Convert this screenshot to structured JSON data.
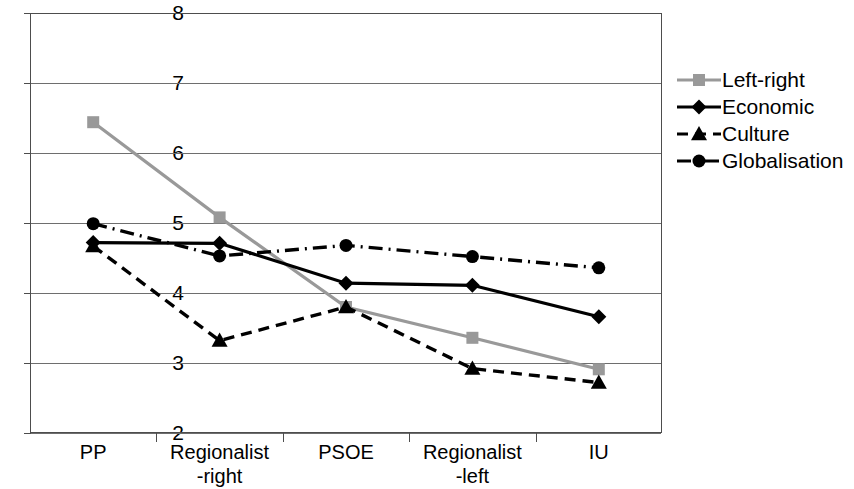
{
  "chart_data": {
    "type": "line",
    "title": "",
    "xlabel": "",
    "ylabel": "",
    "categories": [
      "PP",
      "Regionalist\n-right",
      "PSOE",
      "Regionalist\n-left",
      "IU"
    ],
    "category_labels_line1": [
      "PP",
      "Regionalist",
      "PSOE",
      "Regionalist",
      "IU"
    ],
    "category_labels_line2": [
      "",
      "-right",
      "",
      "-left",
      ""
    ],
    "ylim": [
      2,
      8
    ],
    "yticks": [
      2,
      3,
      4,
      5,
      6,
      7,
      8
    ],
    "grid": true,
    "legend_position": "right",
    "series": [
      {
        "name": "Left-right",
        "values": [
          6.44,
          5.08,
          3.8,
          3.36,
          2.91
        ],
        "color": "#999999",
        "marker": "square",
        "dash": "solid"
      },
      {
        "name": "Economic",
        "values": [
          4.72,
          4.71,
          4.14,
          4.11,
          3.66
        ],
        "color": "#000000",
        "marker": "diamond",
        "dash": "solid"
      },
      {
        "name": "Culture",
        "values": [
          4.67,
          3.32,
          3.8,
          2.92,
          2.72
        ],
        "color": "#000000",
        "marker": "triangle",
        "dash": "dashed"
      },
      {
        "name": "Globalisation",
        "values": [
          4.99,
          4.53,
          4.68,
          4.52,
          4.36
        ],
        "color": "#000000",
        "marker": "circle",
        "dash": "dashdot"
      }
    ]
  },
  "legend": {
    "items": [
      {
        "label": "Left-right"
      },
      {
        "label": "Economic"
      },
      {
        "label": "Culture"
      },
      {
        "label": "Globalisation"
      }
    ]
  }
}
